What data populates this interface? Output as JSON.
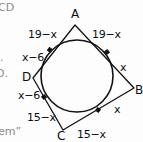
{
  "figure": {
    "background_color": "#fdfdfd",
    "stroke_color": "#111111",
    "vertices": [
      {
        "id": "A",
        "label": "A",
        "x": 75,
        "y": 25
      },
      {
        "id": "B",
        "label": "B",
        "x": 134,
        "y": 88
      },
      {
        "id": "C",
        "label": "C",
        "x": 63,
        "y": 130
      },
      {
        "id": "D",
        "label": "D",
        "x": 33,
        "y": 78
      }
    ],
    "vertex_labels": {
      "A": "A",
      "B": "B",
      "C": "C",
      "D": "D"
    },
    "circle": {
      "center_x": 77,
      "center_y": 76,
      "radius": 36
    },
    "tangent_points": [
      {
        "on_side": "AD",
        "x": 50,
        "y": 50
      },
      {
        "on_side": "AB",
        "x": 107,
        "y": 52
      },
      {
        "on_side": "DC",
        "x": 44,
        "y": 97
      },
      {
        "on_side": "CB",
        "x": 98,
        "y": 110
      }
    ],
    "segment_labels": [
      {
        "id": "AP-left",
        "text": "19−x",
        "x": 28,
        "y": 29
      },
      {
        "id": "AP-right",
        "text": "19−x",
        "x": 92,
        "y": 29
      },
      {
        "id": "DP-upper",
        "text": "x−6",
        "x": 22,
        "y": 52
      },
      {
        "id": "DP-lower",
        "text": "x−6",
        "x": 18,
        "y": 90
      },
      {
        "id": "BP-upper",
        "text": "x",
        "x": 120,
        "y": 62
      },
      {
        "id": "BP-lower",
        "text": "x",
        "x": 114,
        "y": 104
      },
      {
        "id": "CP-left",
        "text": "15−x",
        "x": 27,
        "y": 112
      },
      {
        "id": "CP-right",
        "text": "15−x",
        "x": 77,
        "y": 129
      }
    ],
    "margin_text": [
      {
        "id": "top-left-cut",
        "text": "CD",
        "x": 0,
        "y": 2
      },
      {
        "id": "left-bullet-1",
        "text": ".",
        "x": 2,
        "y": 55
      },
      {
        "id": "left-bullet-2",
        "text": "D.",
        "x": 0,
        "y": 70
      },
      {
        "id": "bottom-left-cut",
        "text": "em”",
        "x": 0,
        "y": 126
      }
    ]
  }
}
